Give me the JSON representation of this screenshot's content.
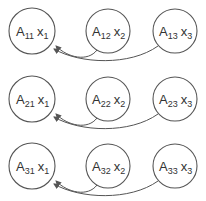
{
  "diagram": {
    "rows": [
      {
        "nodes": [
          {
            "a": "A",
            "a_sub": "11",
            "x": "x",
            "x_sub": "1"
          },
          {
            "a": "A",
            "a_sub": "12",
            "x": "x",
            "x_sub": "2"
          },
          {
            "a": "A",
            "a_sub": "13",
            "x": "x",
            "x_sub": "3"
          }
        ]
      },
      {
        "nodes": [
          {
            "a": "A",
            "a_sub": "21",
            "x": "x",
            "x_sub": "1"
          },
          {
            "a": "A",
            "a_sub": "22",
            "x": "x",
            "x_sub": "2"
          },
          {
            "a": "A",
            "a_sub": "23",
            "x": "x",
            "x_sub": "3"
          }
        ]
      },
      {
        "nodes": [
          {
            "a": "A",
            "a_sub": "31",
            "x": "x",
            "x_sub": "1"
          },
          {
            "a": "A",
            "a_sub": "32",
            "x": "x",
            "x_sub": "2"
          },
          {
            "a": "A",
            "a_sub": "33",
            "x": "x",
            "x_sub": "3"
          }
        ]
      }
    ],
    "edges_per_row": [
      {
        "from": 2,
        "to": 1
      },
      {
        "from": 3,
        "to": 1
      }
    ],
    "stroke_color": "#555555"
  }
}
